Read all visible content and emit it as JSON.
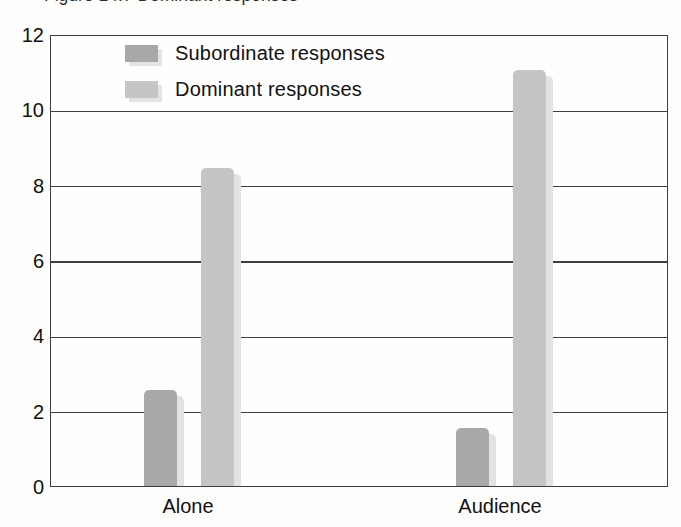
{
  "page": {
    "clipped_caption_fragment": "Figure 14.7 Dominant responses"
  },
  "colors": {
    "background": "#fdfdfb",
    "axis": "#3e3e3e",
    "text": "#111111",
    "bar_shadow": "#e2e2e0",
    "subordinate_bar": "#a8a8a8",
    "dominant_bar": "#c5c5c4"
  },
  "chart_data": {
    "type": "bar",
    "title": "",
    "xlabel": "",
    "ylabel": "",
    "categories": [
      "Alone",
      "Audience"
    ],
    "series": [
      {
        "name": "Subordinate responses",
        "values": [
          2.6,
          1.6
        ],
        "color": "#a8a8a8"
      },
      {
        "name": "Dominant responses",
        "values": [
          8.5,
          11.1
        ],
        "color": "#c5c5c4"
      }
    ],
    "ylim": [
      0,
      12
    ],
    "yticks": [
      0,
      2,
      4,
      6,
      8,
      10,
      12
    ],
    "grid": "horizontal",
    "legend_position": "top-left inside plot"
  }
}
